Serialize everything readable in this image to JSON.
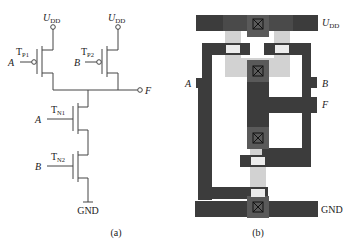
{
  "figure": {
    "schematic": {
      "caption": "(a)",
      "supply_left": {
        "main": "U",
        "sub": "DD"
      },
      "supply_right": {
        "main": "U",
        "sub": "DD"
      },
      "ground": "GND",
      "output": "F",
      "transistors": [
        {
          "id": "TP1",
          "main": "T",
          "sub": "P1",
          "gate": "A",
          "type": "pmos"
        },
        {
          "id": "TP2",
          "main": "T",
          "sub": "P2",
          "gate": "B",
          "type": "pmos"
        },
        {
          "id": "TN1",
          "main": "T",
          "sub": "N1",
          "gate": "A",
          "type": "nmos"
        },
        {
          "id": "TN2",
          "main": "T",
          "sub": "N2",
          "gate": "B",
          "type": "nmos"
        }
      ]
    },
    "layout": {
      "caption": "(b)",
      "supply": {
        "main": "U",
        "sub": "DD"
      },
      "ground": "GND",
      "input_a": "A",
      "input_b": "B",
      "output": "F",
      "colors": {
        "metal": "#3c3c3c",
        "contact_pad": "#5a5a5a",
        "diffusion": "#d2d2d2",
        "gate_region": "#ececec"
      }
    }
  }
}
